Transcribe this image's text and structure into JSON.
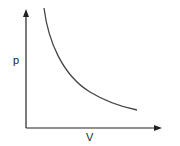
{
  "diagram": {
    "title": "",
    "type": "p-V isotherm",
    "y_axis_label": "p",
    "x_axis_label": "V",
    "curve": "hyperbola p ∝ 1/V",
    "colors": {
      "axis": "#222222",
      "curve": "#444444",
      "background": "#ffffff"
    }
  }
}
